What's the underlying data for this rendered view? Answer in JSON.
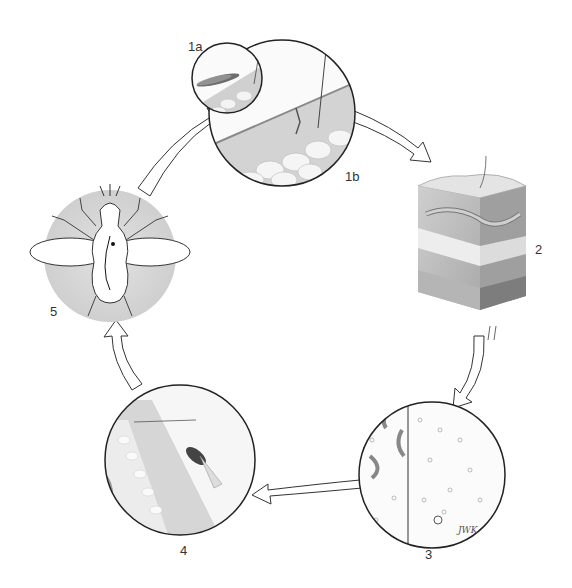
{
  "diagram": {
    "type": "life-cycle",
    "stages": [
      {
        "id": "1a",
        "label": "1a",
        "depicts": "fly biting skin (small inset)"
      },
      {
        "id": "1b",
        "label": "1b",
        "depicts": "magnified skin section with larvae entering"
      },
      {
        "id": "2",
        "label": "2",
        "depicts": "skin tissue block with adult worm"
      },
      {
        "id": "3",
        "label": "3",
        "depicts": "split microscope view of microfilariae"
      },
      {
        "id": "4",
        "label": "4",
        "depicts": "fly feeding on skin"
      },
      {
        "id": "5",
        "label": "5",
        "depicts": "fly anatomy showing larval migration to head"
      }
    ],
    "signature": "JWK",
    "colors": {
      "stroke": "#222222",
      "circle_fill": "#e6e6e6",
      "tissue": "#bdbdbd",
      "fat": "#f0f0f0",
      "background": "#ffffff"
    }
  }
}
